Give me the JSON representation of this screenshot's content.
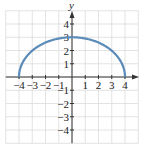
{
  "chart_data": {
    "type": "line",
    "title": "",
    "xlabel": "",
    "ylabel": "y",
    "xlim": [
      -5,
      5
    ],
    "ylim": [
      -5,
      5
    ],
    "grid": true,
    "x_ticks": [
      -4,
      -3,
      -2,
      -1,
      1,
      2,
      3,
      4
    ],
    "y_ticks": [
      -4,
      -3,
      -2,
      -1,
      1,
      2,
      3,
      4
    ],
    "x_tick_labels": [
      "−4",
      "−3",
      "−2",
      "−1",
      "1",
      "2",
      "3",
      "4"
    ],
    "y_tick_labels": [
      "−4",
      "−3",
      "−2",
      "−1",
      "1",
      "2",
      "3",
      "4"
    ],
    "series": [
      {
        "name": "upper semi-ellipse",
        "equation": "y = 3·sqrt(1 − x²/16)",
        "x": [
          -4,
          -3.5,
          -3,
          -2,
          -1,
          0,
          1,
          2,
          3,
          3.5,
          4
        ],
        "y": [
          0,
          1.45,
          1.98,
          2.6,
          2.9,
          3,
          2.9,
          2.6,
          1.98,
          1.45,
          0
        ],
        "color": "#5b8bb8"
      }
    ],
    "colors": {
      "curve": "#5b8bb8",
      "grid": "#dcdcdc",
      "axis": "#333333"
    }
  }
}
